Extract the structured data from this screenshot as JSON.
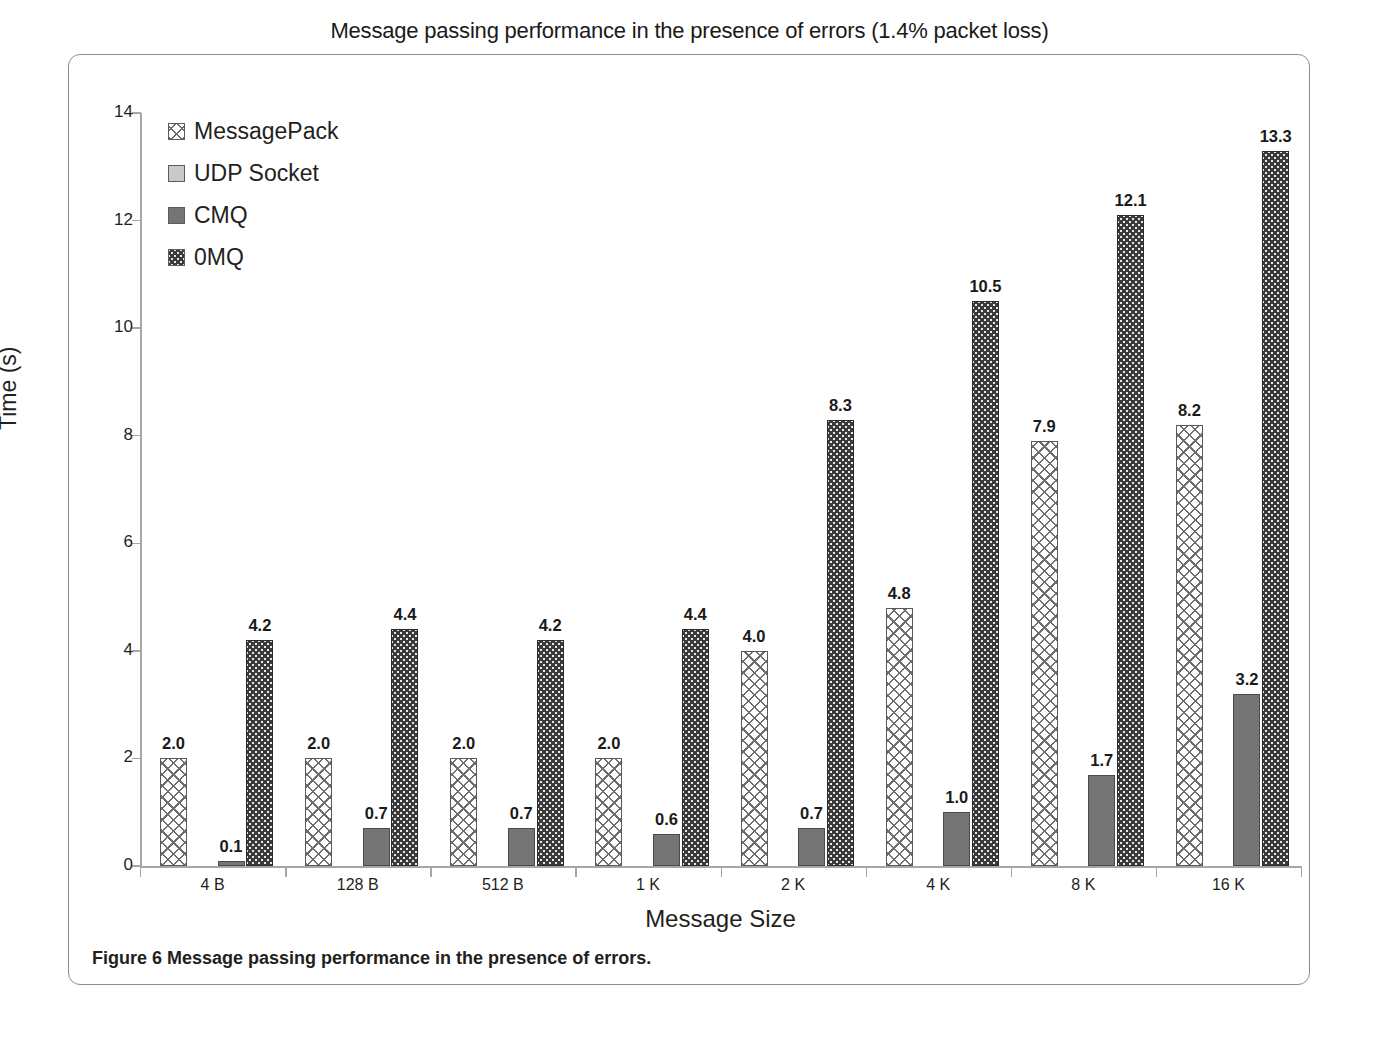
{
  "figure": {
    "caption_prefix": "Figure 6",
    "caption_text": " Message passing performance in the presence of errors."
  },
  "chart_data": {
    "type": "bar",
    "title": "Message passing performance in the presence of errors (1.4% packet loss)",
    "xlabel": "Message Size",
    "ylabel": "Time (s)",
    "ylim": [
      0,
      14
    ],
    "yticks": [
      0,
      2,
      4,
      6,
      8,
      10,
      12,
      14
    ],
    "grid": false,
    "legend_position": "top-left inside plot",
    "categories": [
      "4 B",
      "128 B",
      "512 B",
      "1 K",
      "2 K",
      "4 K",
      "8 K",
      "16 K"
    ],
    "series": [
      {
        "name": "MessagePack",
        "pattern": "crosshatch",
        "color": "#ffffff",
        "values": [
          2.0,
          2.0,
          2.0,
          2.0,
          4.0,
          4.8,
          7.9,
          8.2
        ],
        "labels": [
          "2.0",
          "2.0",
          "2.0",
          "2.0",
          "4.0",
          "4.8",
          "7.9",
          "8.2"
        ]
      },
      {
        "name": "UDP Socket",
        "pattern": "solid-light-gray",
        "color": "#c9c9c9",
        "values": [
          0,
          0,
          0,
          0,
          0,
          0,
          0,
          0
        ],
        "labels": [
          "",
          "",
          "",
          "",
          "",
          "",
          "",
          ""
        ]
      },
      {
        "name": "CMQ",
        "pattern": "solid-dark-gray",
        "color": "#757575",
        "values": [
          0.1,
          0.7,
          0.7,
          0.6,
          0.7,
          1.0,
          1.7,
          3.2
        ],
        "labels": [
          "0.1",
          "0.7",
          "0.7",
          "0.6",
          "0.7",
          "1.0",
          "1.7",
          "3.2"
        ]
      },
      {
        "name": "0MQ",
        "pattern": "dark-dotted",
        "color": "#3b3b3b",
        "values": [
          4.2,
          4.4,
          4.2,
          4.4,
          8.3,
          10.5,
          12.1,
          13.3
        ],
        "labels": [
          "4.2",
          "4.4",
          "4.2",
          "4.4",
          "8.3",
          "10.5",
          "12.1",
          "13.3"
        ]
      }
    ]
  }
}
